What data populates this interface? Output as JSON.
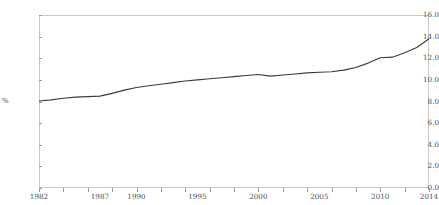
{
  "chart_data": {
    "type": "line",
    "title": "",
    "xlabel": "",
    "ylabel": "%",
    "ylim": [
      0.0,
      16.0
    ],
    "xlim": [
      1982,
      2014
    ],
    "grid": false,
    "legend": "none",
    "y_ticks": [
      "0.0",
      "2.0",
      "4.0",
      "6.0",
      "8.0",
      "10.0",
      "12.0",
      "14.0",
      "16.0"
    ],
    "y_tick_values": [
      0.0,
      2.0,
      4.0,
      6.0,
      8.0,
      10.0,
      12.0,
      14.0,
      16.0
    ],
    "x_tick_labels": [
      "1982",
      "1987",
      "1990",
      "1995",
      "2000",
      "2005",
      "2010",
      "2014"
    ],
    "x_tick_values": [
      1982,
      1987,
      1990,
      1995,
      2000,
      2005,
      2010,
      2014
    ],
    "line_color": "#3b3b3b",
    "line_width": 1.1,
    "series": [
      {
        "name": "share",
        "x": [
          1982,
          1983,
          1984,
          1985,
          1986,
          1987,
          1988,
          1989,
          1990,
          1991,
          1992,
          1993,
          1994,
          1995,
          1996,
          1997,
          1998,
          1999,
          2000,
          2001,
          2002,
          2003,
          2004,
          2005,
          2006,
          2007,
          2008,
          2009,
          2010,
          2011,
          2012,
          2013,
          2014
        ],
        "values": [
          8.05,
          8.15,
          8.3,
          8.4,
          8.45,
          8.5,
          8.75,
          9.05,
          9.3,
          9.45,
          9.6,
          9.75,
          9.9,
          10.0,
          10.1,
          10.2,
          10.3,
          10.4,
          10.5,
          10.35,
          10.45,
          10.55,
          10.65,
          10.7,
          10.75,
          10.9,
          11.15,
          11.55,
          12.05,
          12.1,
          12.5,
          13.0,
          13.8
        ]
      }
    ]
  }
}
